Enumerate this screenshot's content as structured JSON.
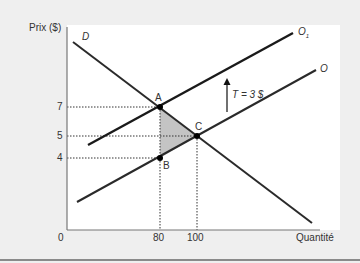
{
  "diagram": {
    "y_axis_label": "Prix ($)",
    "x_axis_label": "Quantité",
    "origin_label": "0",
    "y_ticks": [
      {
        "label": "7",
        "value": 7
      },
      {
        "label": "5",
        "value": 5
      },
      {
        "label": "4",
        "value": 4
      }
    ],
    "x_ticks": [
      {
        "label": "80",
        "value": 80
      },
      {
        "label": "100",
        "value": 100
      }
    ],
    "curves": {
      "demand": "D",
      "supply": "O",
      "supply_with_tax": "O",
      "supply_with_tax_subscript": "1"
    },
    "points": {
      "A": {
        "label": "A",
        "q": 80,
        "p": 7
      },
      "B": {
        "label": "B",
        "q": 80,
        "p": 4
      },
      "C": {
        "label": "C",
        "q": 100,
        "p": 5
      }
    },
    "tax_label": "T = 3 $",
    "shaded_area": "triangle ABC (deadweight loss)",
    "colors": {
      "background": "#efefef",
      "panel": "#ffffff",
      "lines": "#2a2a2a",
      "shade": "#c4c4c4"
    }
  }
}
